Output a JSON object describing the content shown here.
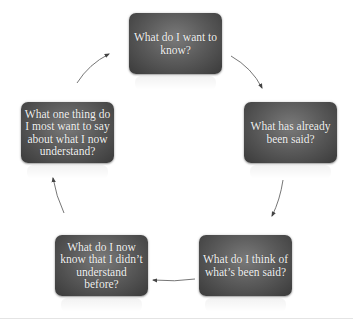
{
  "diagram": {
    "type": "cycle",
    "nodes": [
      {
        "id": "n1",
        "label": "What do I want to know?",
        "x": 129,
        "y": 13
      },
      {
        "id": "n2",
        "label": "What has already been said?",
        "x": 244,
        "y": 102
      },
      {
        "id": "n3",
        "label": "What do I think of what’s been said?",
        "x": 199,
        "y": 235
      },
      {
        "id": "n4",
        "label": "What do I now know that I didn’t understand before?",
        "x": 55,
        "y": 235
      },
      {
        "id": "n5",
        "label": "What one thing do I most want to say about what I now understand?",
        "x": 21,
        "y": 102
      }
    ],
    "edges": [
      {
        "from": "n1",
        "to": "n2"
      },
      {
        "from": "n2",
        "to": "n3"
      },
      {
        "from": "n3",
        "to": "n4"
      },
      {
        "from": "n4",
        "to": "n5"
      },
      {
        "from": "n5",
        "to": "n1"
      }
    ],
    "colors": {
      "node_fill_top": "#7a7a7a",
      "node_fill_bottom": "#3a3a3a",
      "node_text": "#f2f2f2",
      "arrow": "#555555"
    }
  }
}
